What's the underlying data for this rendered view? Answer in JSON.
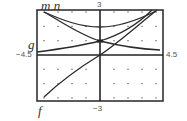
{
  "labels": {
    "curve_top_left": "m n",
    "curve_g": "g",
    "curve_f": "f",
    "ymax": "3",
    "ymin": "−3",
    "xmin": "−4.5",
    "xmax": "4.5"
  },
  "colors": {
    "ink": "#2a2a2a",
    "frame": "#333333",
    "dot": "#555555"
  },
  "chart_data": {
    "type": "line",
    "title": "",
    "xlabel": "",
    "ylabel": "",
    "xlim": [
      -4.5,
      4.5
    ],
    "ylim": [
      -3,
      3
    ],
    "grid": "dots at integer coordinates",
    "x_tick_labels": [
      "-4.5",
      "4.5"
    ],
    "y_tick_labels": [
      "-3",
      "3"
    ],
    "series": [
      {
        "name": "f",
        "description": "increasing curve through origin",
        "x": [
          -4,
          -3,
          -2,
          -1,
          0,
          1,
          2,
          3,
          4
        ],
        "y": [
          -2.75,
          -2.25,
          -1.6,
          -0.85,
          0,
          0.8,
          1.6,
          2.35,
          3.0
        ]
      },
      {
        "name": "g",
        "description": "increasing exponential-like curve",
        "x": [
          -4.5,
          -3,
          -2,
          -1,
          0,
          1,
          2,
          3,
          3.7
        ],
        "y": [
          0.2,
          0.35,
          0.5,
          0.7,
          0.93,
          1.3,
          1.8,
          2.5,
          3.0
        ]
      },
      {
        "name": "m",
        "description": "decreasing exponential-like curve",
        "x": [
          -4,
          -3,
          -2,
          -1,
          0,
          1,
          2,
          3,
          4.3
        ],
        "y": [
          2.8,
          2.2,
          1.7,
          1.25,
          0.93,
          0.68,
          0.5,
          0.38,
          0.3
        ]
      },
      {
        "name": "n",
        "description": "U-shaped curve with minimum on y-axis",
        "x": [
          -4,
          -3,
          -2,
          -1,
          0,
          1,
          2,
          3,
          4
        ],
        "y": [
          2.8,
          2.35,
          2.05,
          1.9,
          1.85,
          1.9,
          2.05,
          2.35,
          2.8
        ]
      }
    ]
  }
}
